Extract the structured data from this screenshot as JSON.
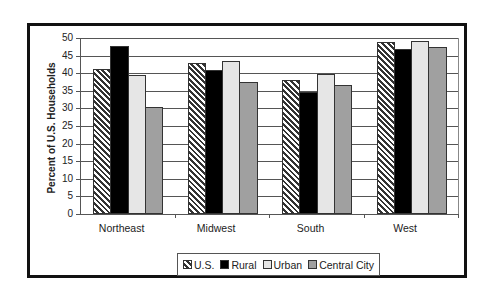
{
  "chart_data": {
    "type": "bar",
    "title": "",
    "xlabel": "",
    "ylabel": "Percent of U.S. Households",
    "ylim": [
      0,
      50
    ],
    "yticks": [
      0,
      5,
      10,
      15,
      20,
      25,
      30,
      35,
      40,
      45,
      50
    ],
    "grid": true,
    "legend_position": "bottom",
    "categories": [
      "Northeast",
      "Midwest",
      "South",
      "West"
    ],
    "series": [
      {
        "name": "U.S.",
        "pattern": "hatch",
        "color": "#ffffff",
        "values": [
          41.2,
          42.8,
          38.0,
          48.9
        ]
      },
      {
        "name": "Rural",
        "pattern": "solid",
        "color": "#000000",
        "values": [
          47.7,
          41.0,
          34.8,
          46.9
        ]
      },
      {
        "name": "Urban",
        "pattern": "solid",
        "color": "#e6e6e6",
        "values": [
          39.5,
          43.5,
          39.7,
          49.2
        ]
      },
      {
        "name": "Central City",
        "pattern": "solid",
        "color": "#a0a0a0",
        "values": [
          30.5,
          37.5,
          36.7,
          47.4
        ]
      }
    ]
  }
}
